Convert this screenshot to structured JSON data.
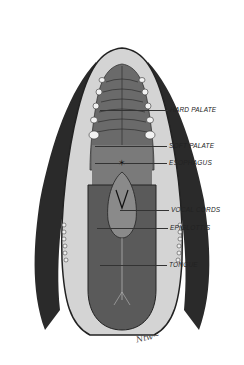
{
  "figure": {
    "colors": {
      "fur": "#2a2a2a",
      "skin": "#cfcfcf",
      "palate": "#6e6e6e",
      "tongue": "#5a5a5a",
      "teeth": "#f2f2f2",
      "background": "#ffffff"
    },
    "signature": "Ntw~"
  },
  "labels": [
    {
      "id": "hard-palate",
      "text": "HARD PALATE",
      "x": 170,
      "y": 107,
      "line_from": 100,
      "line_y": 110
    },
    {
      "id": "soft-palate",
      "text": "SOFT PALATE",
      "x": 169,
      "y": 143,
      "line_from": 95,
      "line_y": 146
    },
    {
      "id": "esophagus",
      "text": "ESOPHAGUS",
      "x": 169,
      "y": 160,
      "line_from": 95,
      "line_y": 163
    },
    {
      "id": "vocal-cords",
      "text": "VOCAL CORDS",
      "x": 171,
      "y": 207,
      "line_from": 120,
      "line_y": 210
    },
    {
      "id": "epiglottis",
      "text": "EPIGLOTTIS",
      "x": 170,
      "y": 225,
      "line_from": 97,
      "line_y": 228
    },
    {
      "id": "tongue",
      "text": "TONGUE",
      "x": 169,
      "y": 262,
      "line_from": 100,
      "line_y": 265
    }
  ]
}
